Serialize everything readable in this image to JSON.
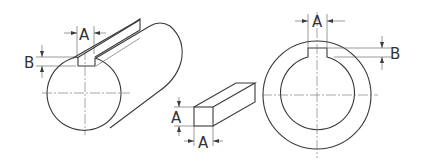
{
  "diagram": {
    "views": [
      {
        "name": "shaft",
        "labels": [
          "A",
          "B"
        ]
      },
      {
        "name": "key",
        "labels": [
          "A",
          "A"
        ]
      },
      {
        "name": "hub",
        "labels": [
          "A",
          "B"
        ]
      }
    ],
    "shaft": {
      "label_width": "A",
      "label_depth": "B"
    },
    "key": {
      "label_height": "A",
      "label_width": "A"
    },
    "hub": {
      "label_width": "A",
      "label_depth": "B"
    },
    "colors": {
      "line": "#3a3a3a",
      "background": "#ffffff"
    }
  }
}
